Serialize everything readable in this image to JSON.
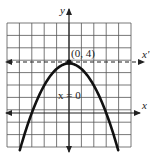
{
  "chart_data": {
    "type": "line",
    "title": "",
    "xlabel": "x",
    "ylabel": "y",
    "grid": true,
    "xlim": [
      -5,
      5
    ],
    "ylim": [
      -3,
      7
    ],
    "series": [
      {
        "name": "parabola",
        "equation": "y = 4 - (4/9)x^2",
        "x": [
          -4,
          -3,
          -2,
          -1,
          0,
          1,
          2,
          3,
          4
        ],
        "y": [
          -3.11,
          0,
          2.22,
          3.56,
          4,
          3.56,
          2.22,
          0,
          -3.11
        ]
      }
    ],
    "annotations": [
      {
        "text": "(0, 4)",
        "x": 0,
        "y": 4,
        "type": "vertex-point"
      },
      {
        "text": "x = 0",
        "x": 0,
        "y": 1.7,
        "type": "axis-of-symmetry-label"
      },
      {
        "text": "x'",
        "type": "dashed-translated-axis",
        "y": 4
      }
    ],
    "axis_labels": {
      "x": "x",
      "y": "y",
      "x_prime": "x'"
    }
  },
  "labels": {
    "y_axis": "y",
    "x_axis": "x",
    "x_prime_axis": "x'",
    "vertex": "(0, 4)",
    "symmetry": "x = 0"
  },
  "colors": {
    "grid": "#555555",
    "axis": "#222222",
    "curve": "#111111",
    "background": "#ffffff"
  }
}
